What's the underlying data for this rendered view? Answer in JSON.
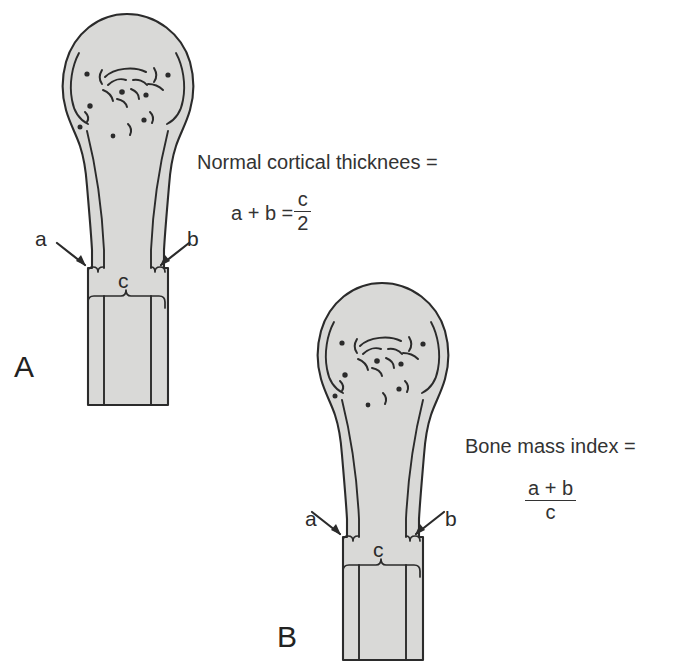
{
  "figure": {
    "background_color": "#ffffff",
    "bone_fill_color": "#d9d9d7",
    "outline_color": "#2b2b2b",
    "text_color": "#333333"
  },
  "panels": [
    {
      "id": "A",
      "letter": "A",
      "description": "Normal bone with thick cortices",
      "labels": {
        "a": "a",
        "b": "b",
        "c": "c"
      }
    },
    {
      "id": "B",
      "letter": "B",
      "description": "Osteoporotic bone with thin cortices",
      "labels": {
        "a": "a",
        "b": "b",
        "c": "c"
      }
    }
  ],
  "formulas": [
    {
      "id": "normal-cortical-thickness",
      "heading": "Normal cortical thicknees =",
      "expression_left": "a + b =",
      "numerator": "c",
      "denominator": "2"
    },
    {
      "id": "bone-mass-index",
      "heading": "Bone mass index =",
      "expression_left": "",
      "numerator": "a + b",
      "denominator": "c"
    }
  ]
}
